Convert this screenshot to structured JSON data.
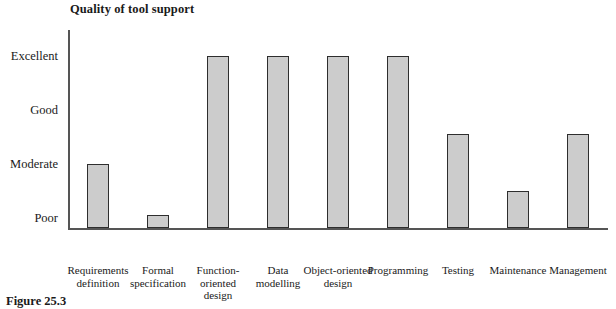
{
  "chart_data": {
    "type": "bar",
    "title": "Quality of tool support",
    "xlabel": "",
    "ylabel": "",
    "grid": false,
    "legend": null,
    "orientation": "vertical",
    "y_scale": "ordinal",
    "ytick_labels": [
      "Excellent",
      "Good",
      "Moderate",
      "Poor"
    ],
    "ylim": [
      "baseline",
      "Excellent"
    ],
    "categories": [
      "Requirements\ndefinition",
      "Formal\nspecification",
      "Function-\noriented\ndesign",
      "Data\nmodelling",
      "Object-oriented\ndesign",
      "Programming",
      "Testing",
      "Maintenance",
      "Management"
    ],
    "category_labels_flat": [
      "Requirements definition",
      "Formal specification",
      "Function-oriented design",
      "Data modelling",
      "Object-oriented design",
      "Programming",
      "Testing",
      "Maintenance",
      "Management"
    ],
    "value_labels": [
      "Moderate",
      "Poor",
      "Excellent",
      "Excellent",
      "Excellent",
      "Excellent",
      "Good / Moderate",
      "Moderate / Poor",
      "Good / Moderate"
    ],
    "values": [
      2.0,
      1.05,
      4.0,
      4.0,
      4.0,
      4.0,
      2.55,
      1.5,
      2.55
    ],
    "value_scale_note": "Poor = 1, Moderate = 2, Good = 3, Excellent = 4",
    "colors": {
      "bar_fill": "#cccccc",
      "bar_border": "#2e2e2e",
      "axis": "#555555",
      "text": "#1a1a1a",
      "background": "#ffffff"
    }
  },
  "caption": {
    "text": "Figure 25.3"
  }
}
